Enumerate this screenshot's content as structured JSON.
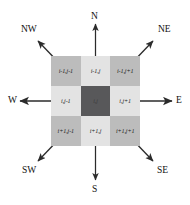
{
  "figure": {
    "type": "neighbourhood-grid-diagram"
  },
  "grid": {
    "rows": [
      {
        "cells": [
          {
            "label": "i-1,j-1",
            "shade": "corner"
          },
          {
            "label": "i-1,j",
            "shade": "edge"
          },
          {
            "label": "i-1,j+1",
            "shade": "corner"
          }
        ]
      },
      {
        "cells": [
          {
            "label": "i,j-1",
            "shade": "edge"
          },
          {
            "label": "i,j",
            "shade": "center"
          },
          {
            "label": "i,j+1",
            "shade": "edge"
          }
        ]
      },
      {
        "cells": [
          {
            "label": "i+1,j-1",
            "shade": "corner"
          },
          {
            "label": "i+1,j",
            "shade": "edge"
          },
          {
            "label": "i+1,j+1",
            "shade": "corner"
          }
        ]
      }
    ]
  },
  "compass": {
    "n": "N",
    "ne": "NE",
    "e": "E",
    "se": "SE",
    "s": "S",
    "sw": "SW",
    "w": "W",
    "nw": "NW"
  },
  "colors": {
    "corner_cell": "#bcbcbc",
    "edge_cell": "#e3e3e3",
    "center_cell": "#58585a",
    "arrow": "#2b2b2b",
    "text": "#111111",
    "background": "#ffffff"
  }
}
